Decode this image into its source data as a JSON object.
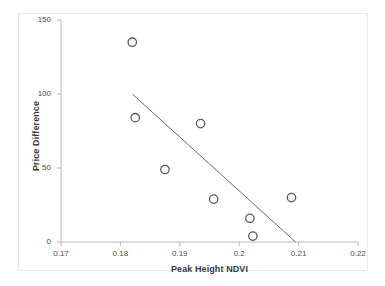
{
  "chart_data": {
    "type": "scatter",
    "title": "",
    "xlabel": "Peak Height NDVI",
    "ylabel": "Price Difference",
    "xlim": [
      0.17,
      0.22
    ],
    "ylim": [
      0,
      150
    ],
    "xticks": [
      "0.17",
      "0.18",
      "0.19",
      "0.2",
      "0.21",
      "0.22"
    ],
    "xtick_values": [
      0.17,
      0.18,
      0.19,
      0.2,
      0.21,
      0.22
    ],
    "yticks": [
      "0",
      "50",
      "100",
      "150"
    ],
    "ytick_values": [
      0,
      50,
      100,
      150
    ],
    "grid": false,
    "legend": null,
    "marker": "open-circle",
    "marker_color": "#595959",
    "points": [
      {
        "x": 0.182,
        "y": 135
      },
      {
        "x": 0.1825,
        "y": 84
      },
      {
        "x": 0.1875,
        "y": 49
      },
      {
        "x": 0.1935,
        "y": 80
      },
      {
        "x": 0.1957,
        "y": 29
      },
      {
        "x": 0.2018,
        "y": 16
      },
      {
        "x": 0.2023,
        "y": 4
      },
      {
        "x": 0.2088,
        "y": 30
      }
    ],
    "trendline": {
      "type": "linear",
      "color": "#6b6b6b",
      "x_start": 0.182,
      "y_start": 100,
      "x_end": 0.2095,
      "y_end": 0
    }
  },
  "axis": {
    "y_title": "Price Difference",
    "x_title": "Peak Height NDVI"
  }
}
